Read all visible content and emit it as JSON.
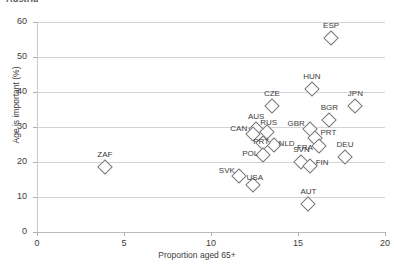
{
  "figure": {
    "cut_title": "Austria",
    "xlabel": "Proportion aged 65+",
    "ylabel": "Age is important (%)"
  },
  "chart_data": {
    "type": "scatter",
    "title": "",
    "xlabel": "Proportion aged 65+",
    "ylabel": "Age is important (%)",
    "xlim": [
      0,
      20
    ],
    "ylim": [
      0,
      60
    ],
    "xticks": [
      0,
      5,
      10,
      15,
      20
    ],
    "yticks": [
      0,
      10,
      20,
      30,
      40,
      50,
      60
    ],
    "grid": "horizontal",
    "legend": "none",
    "marker": "open-diamond",
    "points": [
      {
        "label": "ESP",
        "x": 16.9,
        "y": 55.5
      },
      {
        "label": "HUN",
        "x": 15.8,
        "y": 41.0
      },
      {
        "label": "CZE",
        "x": 13.5,
        "y": 36.0
      },
      {
        "label": "JPN",
        "x": 18.3,
        "y": 36.0
      },
      {
        "label": "BGR",
        "x": 16.8,
        "y": 32.0
      },
      {
        "label": "AUS",
        "x": 12.6,
        "y": 29.5
      },
      {
        "label": "RUS",
        "x": 13.2,
        "y": 28.5
      },
      {
        "label": "CAN",
        "x": 12.4,
        "y": 28.0
      },
      {
        "label": "GBR",
        "x": 15.7,
        "y": 29.5
      },
      {
        "label": "PRT",
        "x": 16.0,
        "y": 27.0
      },
      {
        "label": "NLD",
        "x": 13.6,
        "y": 25.0
      },
      {
        "label": "PRT2",
        "x": 13.0,
        "y": 25.5
      },
      {
        "label": "FRA",
        "x": 16.2,
        "y": 24.5
      },
      {
        "label": "POL",
        "x": 13.0,
        "y": 22.0
      },
      {
        "label": "DEU",
        "x": 17.7,
        "y": 21.5
      },
      {
        "label": "SVN",
        "x": 15.2,
        "y": 20.0
      },
      {
        "label": "FIN",
        "x": 15.7,
        "y": 19.0
      },
      {
        "label": "ZAF",
        "x": 3.9,
        "y": 18.5
      },
      {
        "label": "SVK",
        "x": 11.6,
        "y": 16.0
      },
      {
        "label": "USA",
        "x": 12.4,
        "y": 13.5
      },
      {
        "label": "AUT",
        "x": 15.6,
        "y": 8.0
      }
    ],
    "label_offsets": [
      {
        "label": "ESP",
        "dx": 0,
        "dy": -17
      },
      {
        "label": "HUN",
        "dx": 0,
        "dy": -17
      },
      {
        "label": "CZE",
        "dx": 0,
        "dy": -17
      },
      {
        "label": "JPN",
        "dx": 0,
        "dy": -17
      },
      {
        "label": "BGR",
        "dx": 0,
        "dy": -17
      },
      {
        "label": "AUS",
        "dx": 0,
        "dy": -17
      },
      {
        "label": "RUS",
        "dx": 2,
        "dy": -14
      },
      {
        "label": "CAN",
        "dx": -14,
        "dy": -10
      },
      {
        "label": "GBR",
        "dx": -14,
        "dy": -10
      },
      {
        "label": "PRT",
        "dx": 13,
        "dy": -10
      },
      {
        "label": "NLD",
        "dx": 13,
        "dy": -6
      },
      {
        "label": "PRT2",
        "dx": -2,
        "dy": -6
      },
      {
        "label": "FRA",
        "dx": -14,
        "dy": -3
      },
      {
        "label": "POL",
        "dx": -13,
        "dy": -6
      },
      {
        "label": "DEU",
        "dx": 0,
        "dy": -17
      },
      {
        "label": "SVN",
        "dx": 0,
        "dy": -17
      },
      {
        "label": "FIN",
        "dx": 12,
        "dy": -8
      },
      {
        "label": "ZAF",
        "dx": 0,
        "dy": -17
      },
      {
        "label": "SVK",
        "dx": -12,
        "dy": -10
      },
      {
        "label": "USA",
        "dx": 2,
        "dy": -12
      },
      {
        "label": "AUT",
        "dx": 0,
        "dy": -17
      }
    ]
  }
}
